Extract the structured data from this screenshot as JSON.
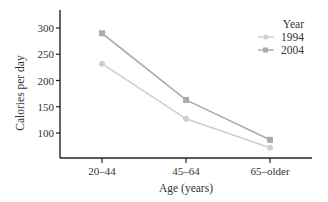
{
  "chart_data": {
    "type": "line",
    "title": "",
    "xlabel": "Age (years)",
    "ylabel": "Calories per day",
    "categories": [
      "20–44",
      "45–64",
      "65–older"
    ],
    "series": [
      {
        "name": "1994",
        "values": [
          232,
          127,
          72
        ],
        "color": "#cfcfcf",
        "marker": "circle"
      },
      {
        "name": "2004",
        "values": [
          290,
          163,
          87
        ],
        "color": "#ababab",
        "marker": "square"
      }
    ],
    "yticks": [
      100,
      150,
      200,
      250,
      300
    ],
    "ytick_labels": [
      "100",
      "150",
      "200",
      "250",
      "300"
    ],
    "ylim": [
      52,
      335
    ],
    "grid": false,
    "legend": {
      "title": "Year",
      "position": "top-right",
      "entries": [
        "1994",
        "2004"
      ]
    }
  }
}
